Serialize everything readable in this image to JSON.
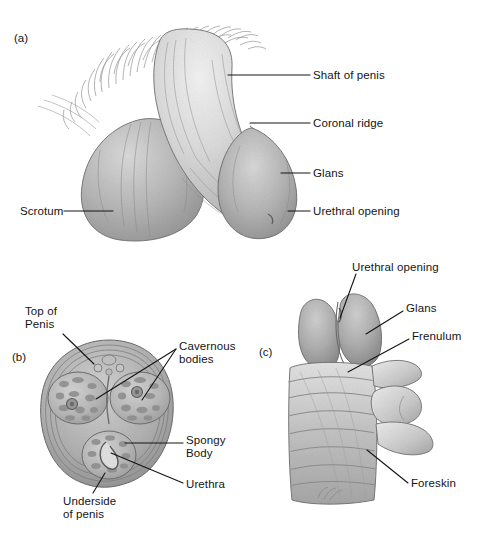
{
  "figure": {
    "background_color": "#ffffff",
    "ink_color": "#141414",
    "medium": "grayscale pencil illustration"
  },
  "panels": [
    {
      "marker": "(a)",
      "marker_x": 14,
      "marker_y": 32,
      "view": "external side view of penis and scrotum with pubic hair",
      "labels": [
        {
          "name": "shaft-of-penis",
          "text": "Shaft of penis",
          "x": 313,
          "y": 69,
          "align": "left",
          "leader": [
            [
              310,
              75
            ],
            [
              228,
              75
            ]
          ]
        },
        {
          "name": "coronal-ridge",
          "text": "Coronal ridge",
          "x": 313,
          "y": 117,
          "align": "left",
          "leader": [
            [
              310,
              123
            ],
            [
              250,
              123
            ]
          ]
        },
        {
          "name": "glans",
          "text": "Glans",
          "x": 313,
          "y": 167,
          "align": "left",
          "leader": [
            [
              310,
              173
            ],
            [
              281,
              173
            ]
          ]
        },
        {
          "name": "urethral-opening",
          "text": "Urethral opening",
          "x": 313,
          "y": 205,
          "align": "left",
          "leader": [
            [
              310,
              211
            ],
            [
              288,
              211
            ]
          ]
        },
        {
          "name": "scrotum",
          "text": "Scrotum",
          "x": 20,
          "y": 205,
          "align": "left",
          "leader": [
            [
              64,
              211
            ],
            [
              113,
              211
            ]
          ]
        }
      ]
    },
    {
      "marker": "(b)",
      "marker_x": 12,
      "marker_y": 351,
      "view": "cross-section of the penis shaft",
      "labels": [
        {
          "name": "top-of-penis",
          "text": "Top of\nPenis",
          "x": 25,
          "y": 305,
          "align": "left",
          "leader": [
            [
              63,
              334
            ],
            [
              94,
              364
            ]
          ]
        },
        {
          "name": "cavernous-bodies",
          "text": "Cavernous\nbodies",
          "x": 179,
          "y": 340,
          "align": "left",
          "leader": [
            [
              176,
              349
            ],
            [
              96,
              399
            ]
          ]
        },
        {
          "name": "cavernous-bodies-2",
          "text": "",
          "x": 0,
          "y": 0,
          "align": "left",
          "leader": [
            [
              176,
              349
            ],
            [
              142,
              400
            ]
          ]
        },
        {
          "name": "spongy-body",
          "text": "Spongy\nBody",
          "x": 186,
          "y": 434,
          "align": "left",
          "leader": [
            [
              183,
              443
            ],
            [
              125,
              443
            ]
          ]
        },
        {
          "name": "urethra",
          "text": "Urethra",
          "x": 186,
          "y": 478,
          "align": "left",
          "leader": [
            [
              183,
              483
            ],
            [
              111,
              453
            ]
          ]
        },
        {
          "name": "underside-of-penis",
          "text": "Underside\nof penis",
          "x": 63,
          "y": 495,
          "align": "left",
          "leader": [
            [
              93,
              493
            ],
            [
              105,
              473
            ]
          ]
        }
      ]
    },
    {
      "marker": "(c)",
      "marker_x": 259,
      "marker_y": 346,
      "view": "close-up of glans with retracted foreskin",
      "labels": [
        {
          "name": "urethral-opening",
          "text": "Urethral opening",
          "x": 352,
          "y": 261,
          "align": "left",
          "leader": [
            [
              356,
              274
            ],
            [
              340,
              318
            ]
          ]
        },
        {
          "name": "glans",
          "text": "Glans",
          "x": 406,
          "y": 302,
          "align": "left",
          "leader": [
            [
              403,
              311
            ],
            [
              366,
              334
            ]
          ]
        },
        {
          "name": "frenulum",
          "text": "Frenulum",
          "x": 412,
          "y": 330,
          "align": "left",
          "leader": [
            [
              409,
              339
            ],
            [
              348,
              372
            ]
          ]
        },
        {
          "name": "foreskin",
          "text": "Foreskin",
          "x": 411,
          "y": 477,
          "align": "left",
          "leader": [
            [
              408,
              483
            ],
            [
              367,
              450
            ]
          ]
        }
      ]
    }
  ]
}
